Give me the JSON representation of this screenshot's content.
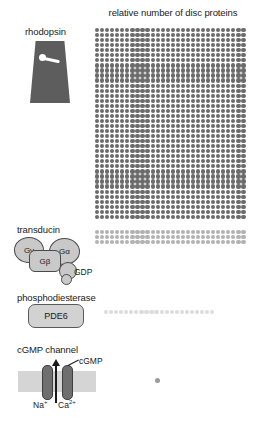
{
  "title": "relative number of disc proteins",
  "rows": [
    {
      "key": "rhodopsin",
      "label": "rhodopsin",
      "dot_color": "#6b6b6b",
      "columns": 30,
      "dot_rows": 38,
      "dot_size": 4.2,
      "dot_gap": 0.85,
      "total_dots": 1140
    },
    {
      "key": "transducin",
      "label": "transducin",
      "dot_color": "#b2b2b2",
      "columns": 30,
      "dot_rows": 3,
      "dot_size": 4.2,
      "dot_gap": 0.85,
      "total_dots": 90
    },
    {
      "key": "phosphodiesterase",
      "label": "phosphodiesterase",
      "dot_color": "#dcdcdc",
      "columns": 22,
      "dot_rows": 1,
      "dot_size": 4.2,
      "dot_gap": 0.85,
      "total_dots": 22
    },
    {
      "key": "cgmp_channel",
      "label": "cGMP channel",
      "dot_color": "#9c9c9c",
      "columns": 1,
      "dot_rows": 1,
      "dot_size": 5,
      "dot_gap": 0.85,
      "total_dots": 1
    }
  ],
  "icons": {
    "rhodopsin": {
      "shape": "membrane-protein-trapezoid",
      "body_color": "#5d5d5d",
      "retinal_color": "#ffffff"
    },
    "transducin": {
      "subunits": [
        {
          "id": "g-gamma",
          "label": "Gγ"
        },
        {
          "id": "g-alpha",
          "label": "Gα"
        },
        {
          "id": "g-beta",
          "label": "Gβ"
        }
      ],
      "ligand_label": "GDP",
      "fill_color": "#c9c9c9",
      "stroke_color": "#4a4a4a"
    },
    "phosphodiesterase": {
      "label": "PDE6",
      "fill_color": "#d2d2d2",
      "stroke_color": "#5a5a5a"
    },
    "cgmp_channel": {
      "ligand_label": "cGMP",
      "ion_labels": [
        {
          "id": "sodium",
          "base": "Na",
          "charge": "+"
        },
        {
          "id": "calcium",
          "base": "Ca",
          "charge": "2+"
        }
      ],
      "membrane_color": "#d5d5d5",
      "pillar_color": "#6f6f6f"
    }
  },
  "chart_data": {
    "type": "bar",
    "title": "relative number of disc proteins",
    "xlabel": "",
    "ylabel": "",
    "categories": [
      "rhodopsin",
      "transducin",
      "phosphodiesterase",
      "cGMP channel"
    ],
    "values": [
      1140,
      90,
      22,
      1
    ],
    "value_unit": "dots (each dot = one relative unit)",
    "encoding": "pictogram grid of dots; one dot per relative unit",
    "grid": false,
    "legend": "none"
  }
}
